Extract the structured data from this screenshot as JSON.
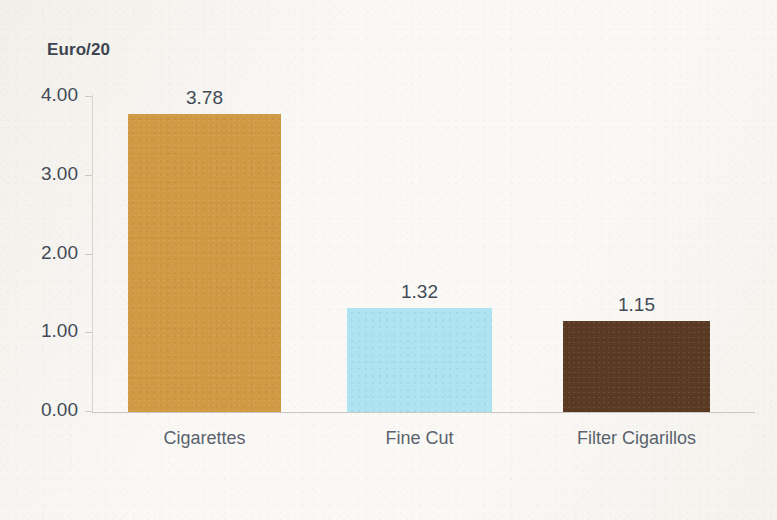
{
  "chart_data": {
    "type": "bar",
    "title": "Euro/20",
    "xlabel": "",
    "ylabel": "Euro/20",
    "categories": [
      "Cigarettes",
      "Fine Cut",
      "Filter Cigarillos"
    ],
    "values": [
      3.78,
      1.32,
      1.15
    ],
    "value_labels": [
      "3.78",
      "1.32",
      "1.15"
    ],
    "bar_colors": [
      "#d09a45",
      "#aee4f2",
      "#5a3a22"
    ],
    "ylim": [
      0,
      4
    ],
    "ytick_values": [
      4,
      3,
      2,
      1,
      0
    ],
    "ytick_labels": [
      "4.00",
      "3.00",
      "2.00",
      "1.00",
      "0.00"
    ],
    "grid": false,
    "legend": false,
    "background_color": "#faf9f6",
    "text_color": "#434b56",
    "axis_color": "#c9c7c1"
  }
}
